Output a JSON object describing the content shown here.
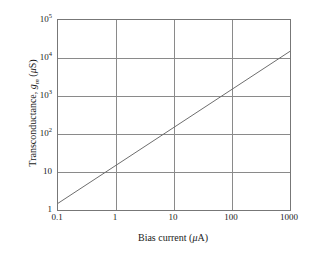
{
  "chart_data": {
    "type": "line",
    "title": "",
    "xlabel": "Bias current (μA)",
    "ylabel": "Transconductance, gₘ (μS)",
    "xscale": "log",
    "yscale": "log",
    "xlim": [
      0.1,
      1000
    ],
    "ylim": [
      1,
      100000
    ],
    "grid": true,
    "legend": "none",
    "x_ticks": [
      "0.1",
      "1",
      "10",
      "100",
      "1000"
    ],
    "x_tick_values": [
      0.1,
      1,
      10,
      100,
      1000
    ],
    "y_ticks": [
      "1",
      "10",
      "10^2",
      "10^3",
      "10^4",
      "10^5"
    ],
    "y_tick_values": [
      1,
      10,
      100,
      1000,
      10000,
      100000
    ],
    "series": [
      {
        "name": "transconductance",
        "color": "#6e6e6e",
        "x": [
          0.1,
          1,
          10,
          100,
          1000
        ],
        "values": [
          1.5,
          15,
          150,
          1500,
          15000
        ]
      }
    ]
  },
  "axes": {
    "x_title_prefix": "Bias current (",
    "x_title_mu": "μ",
    "x_title_suffix": "A)",
    "y_title_prefix": "Transconductance, ",
    "y_title_symbol": "g",
    "y_title_subscript": "m",
    "y_title_open": " (",
    "y_title_mu": "μ",
    "y_title_suffix": "S)"
  },
  "y_labels": [
    {
      "mantissa": "10",
      "exponent": "5"
    },
    {
      "mantissa": "10",
      "exponent": "4"
    },
    {
      "mantissa": "10",
      "exponent": "3"
    },
    {
      "mantissa": "10",
      "exponent": "2"
    },
    {
      "mantissa": "10",
      "exponent": ""
    },
    {
      "mantissa": "1",
      "exponent": ""
    }
  ],
  "x_labels": [
    {
      "text": "0.1"
    },
    {
      "text": "1"
    },
    {
      "text": "10"
    },
    {
      "text": "100"
    },
    {
      "text": "1000"
    }
  ],
  "colors": {
    "grid": "#8a8a8a",
    "frame": "#777777",
    "series": "#6e6e6e",
    "background": "#ffffff",
    "text": "#1a1a1a"
  }
}
